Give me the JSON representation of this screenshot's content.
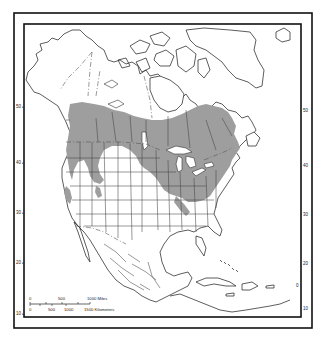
{
  "map": {
    "title": "",
    "region": "North America",
    "feature": "species range (shaded)",
    "colors": {
      "range_fill": "#9e9e9e",
      "land_fill": "#ffffff",
      "outline": "#333333",
      "frame": "#111111"
    },
    "latitude_labels_left": [
      {
        "label": "50",
        "y": 106
      },
      {
        "label": "40",
        "y": 162
      },
      {
        "label": "30",
        "y": 212
      },
      {
        "label": "20",
        "y": 262
      },
      {
        "label": "10",
        "y": 313
      }
    ],
    "latitude_labels_right": [
      {
        "label": "50",
        "y": 111
      },
      {
        "label": "40",
        "y": 166
      },
      {
        "label": "30",
        "y": 215
      },
      {
        "label": "20",
        "y": 264
      },
      {
        "label": "0",
        "y": 286
      },
      {
        "label": "10",
        "y": 309
      }
    ],
    "scale_bar": {
      "miles_labels": [
        "0",
        "500",
        "1000 Miles"
      ],
      "km_labels": [
        "0",
        "500",
        "1000",
        "1500 Kilometers"
      ]
    }
  }
}
